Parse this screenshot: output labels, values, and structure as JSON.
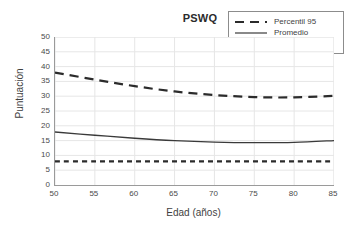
{
  "chart_data": {
    "type": "line",
    "title": "PSWQ",
    "xlabel": "Edad (años)",
    "ylabel": "Puntuación",
    "xlim": [
      50,
      85
    ],
    "ylim": [
      0,
      50
    ],
    "xticks": [
      50,
      55,
      60,
      65,
      70,
      75,
      80,
      85
    ],
    "yticks": [
      0,
      5,
      10,
      15,
      20,
      25,
      30,
      35,
      40,
      45,
      50
    ],
    "grid": true,
    "legend_position": "top-right",
    "x": [
      50,
      55,
      60,
      65,
      70,
      75,
      80,
      85
    ],
    "series": [
      {
        "name": "Percentil 95",
        "style": "long-dash",
        "color": "#2b2b2b",
        "values": [
          38.0,
          35.6,
          33.4,
          31.6,
          30.4,
          29.7,
          29.6,
          30.1
        ]
      },
      {
        "name": "Promedio",
        "style": "solid",
        "color": "#3a3a3a",
        "values": [
          17.9,
          16.8,
          15.8,
          15.0,
          14.5,
          14.3,
          14.4,
          15.0
        ]
      },
      {
        "name": "Percentil 5",
        "style": "short-dash",
        "color": "#2b2b2b",
        "values": [
          8.0,
          8.0,
          8.0,
          8.0,
          8.0,
          8.0,
          8.0,
          8.0
        ]
      }
    ]
  },
  "legend": {
    "entries": [
      {
        "label": "Percentil 95"
      },
      {
        "label": "Promedio"
      },
      {
        "label": "Percentil 5"
      }
    ]
  },
  "axis": {
    "y_tick_labels": [
      "50",
      "45",
      "40",
      "35",
      "30",
      "25",
      "20",
      "15",
      "10",
      "5",
      "0"
    ],
    "x_tick_labels": [
      "50",
      "55",
      "60",
      "65",
      "70",
      "75",
      "80",
      "85"
    ]
  },
  "colors": {
    "line": "#2b2b2b",
    "grid": "#e6e6e6",
    "axis": "#9a9a9a",
    "text": "#3f3f3f",
    "background": "#ffffff"
  }
}
